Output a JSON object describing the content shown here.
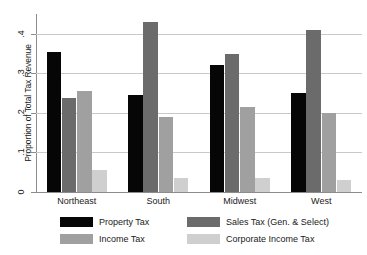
{
  "chart_data": {
    "type": "bar",
    "title": "",
    "subtitle": "",
    "xlabel": "",
    "ylabel": "Proportion of Total Tax Revenue",
    "ylim": [
      0,
      0.45
    ],
    "yticks": [
      0,
      0.1,
      0.2,
      0.3,
      0.4
    ],
    "ytick_labels": [
      "0",
      ".1",
      ".2",
      ".3",
      ".4"
    ],
    "grid": true,
    "legend_position": "bottom",
    "categories": [
      "Northeast",
      "South",
      "Midwest",
      "West"
    ],
    "series": [
      {
        "name": "Property Tax",
        "color": "#060606",
        "values": [
          0.355,
          0.245,
          0.32,
          0.25
        ]
      },
      {
        "name": "Sales Tax (Gen. & Select)",
        "color": "#6b6b6b",
        "values": [
          0.238,
          0.43,
          0.35,
          0.41
        ]
      },
      {
        "name": "Income Tax",
        "color": "#a0a0a0",
        "values": [
          0.255,
          0.19,
          0.215,
          0.2
        ]
      },
      {
        "name": "Corporate Income Tax",
        "color": "#cfcfcf",
        "values": [
          0.055,
          0.035,
          0.035,
          0.03
        ]
      }
    ]
  },
  "axis": {
    "y_title": "Proportion of Total Tax Revenue",
    "tick_0": "0",
    "tick_1": ".1",
    "tick_2": ".2",
    "tick_3": ".3",
    "tick_4": ".4"
  },
  "categories": {
    "c0": "Northeast",
    "c1": "South",
    "c2": "Midwest",
    "c3": "West"
  },
  "legend": {
    "items": [
      {
        "label": "Property Tax",
        "color": "#060606"
      },
      {
        "label": "Income Tax",
        "color": "#a0a0a0"
      },
      {
        "label": "Sales Tax (Gen. & Select)",
        "color": "#6b6b6b"
      },
      {
        "label": "Corporate Income Tax",
        "color": "#cfcfcf"
      }
    ]
  },
  "colors": {
    "property": "#060606",
    "sales": "#6b6b6b",
    "income": "#a0a0a0",
    "corporate": "#cfcfcf",
    "gridline": "#c9c9c9",
    "axis": "#8c8c8c",
    "background": "#ffffff"
  }
}
